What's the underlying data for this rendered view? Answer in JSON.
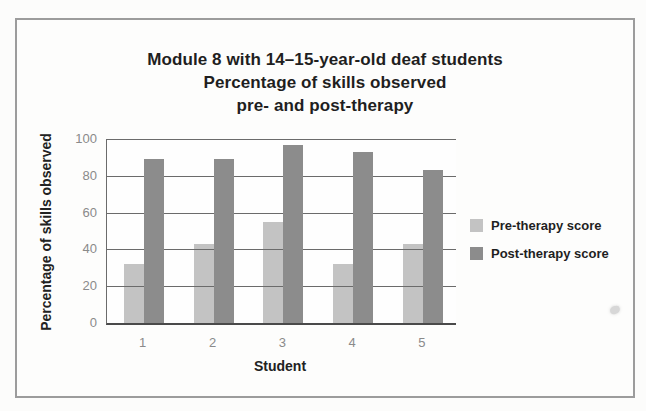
{
  "chart_data": {
    "type": "bar",
    "title": "Module 8 with 14–15-year-old deaf students Percentage of skills observed pre- and post-therapy",
    "title_lines": [
      "Module 8 with 14–15-year-old deaf students",
      "Percentage of skills observed",
      "pre- and post-therapy"
    ],
    "categories": [
      "1",
      "2",
      "3",
      "4",
      "5"
    ],
    "series": [
      {
        "name": "Pre-therapy score",
        "color": "#c3c3c3",
        "values": [
          32,
          43,
          55,
          32,
          43
        ]
      },
      {
        "name": "Post-therapy score",
        "color": "#8c8c8c",
        "values": [
          89,
          89,
          97,
          93,
          83
        ]
      }
    ],
    "xlabel": "Student",
    "ylabel": "Percentage of skills observed",
    "ylim": [
      0,
      100
    ],
    "yticks": [
      0,
      20,
      40,
      60,
      80,
      100
    ],
    "grid": true,
    "legend_position": "right",
    "legend_labels": [
      "Pre-therapy score",
      "Post-therapy score"
    ]
  }
}
